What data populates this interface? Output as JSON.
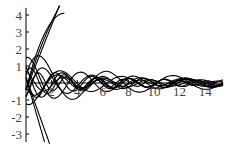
{
  "chart_data": {
    "type": "line",
    "title": "",
    "xlabel": "",
    "ylabel": "",
    "xlim": [
      0,
      16
    ],
    "ylim": [
      -3.5,
      4.3
    ],
    "x_ticks": [
      2,
      4,
      6,
      8,
      10,
      12,
      14
    ],
    "x_tick_labels": [
      "2",
      "4",
      "6",
      "8",
      "10",
      "12",
      "14"
    ],
    "y_ticks": [
      -3,
      -2,
      -1,
      1,
      2,
      3,
      4
    ],
    "y_tick_labels": [
      "-3",
      "-2",
      "-1",
      "1",
      "2",
      "3",
      "4"
    ],
    "grid": false,
    "legend": "none",
    "series": [
      {
        "name": "c1",
        "amp": 2.2,
        "freq": 0.55,
        "phase": 0.2
      },
      {
        "name": "c2",
        "amp": 1.6,
        "freq": 0.7,
        "phase": 1.2
      },
      {
        "name": "c3",
        "amp": 1.2,
        "freq": 0.9,
        "phase": 2.2
      },
      {
        "name": "c4",
        "amp": 1.0,
        "freq": 1.1,
        "phase": 0.6
      },
      {
        "name": "c5",
        "amp": 0.9,
        "freq": 0.8,
        "phase": 3.4
      },
      {
        "name": "c6",
        "amp": 1.4,
        "freq": 0.6,
        "phase": 4.2
      },
      {
        "name": "c7",
        "amp": 0.8,
        "freq": 1.3,
        "phase": 5.0
      },
      {
        "name": "c8",
        "amp": 1.1,
        "freq": 1.0,
        "phase": 2.8
      },
      {
        "name": "c9",
        "amp": 0.7,
        "freq": 0.95,
        "phase": 1.7
      },
      {
        "name": "c10",
        "amp": 1.3,
        "freq": 0.75,
        "phase": 5.6
      }
    ],
    "steep_series": [
      {
        "name": "s1",
        "slope": 3.0,
        "curve": -0.05
      },
      {
        "name": "s2",
        "slope": 2.4,
        "curve": -0.02
      },
      {
        "name": "s3",
        "slope": 1.9,
        "curve": 0.0
      },
      {
        "name": "s4",
        "slope": -2.6,
        "curve": 0.0
      },
      {
        "name": "s5",
        "slope": -2.1,
        "curve": 0.0
      }
    ]
  },
  "axes": {
    "origin_px": [
      26,
      83
    ],
    "x_px_per_unit": 12.8,
    "y_px_per_unit": 17
  }
}
